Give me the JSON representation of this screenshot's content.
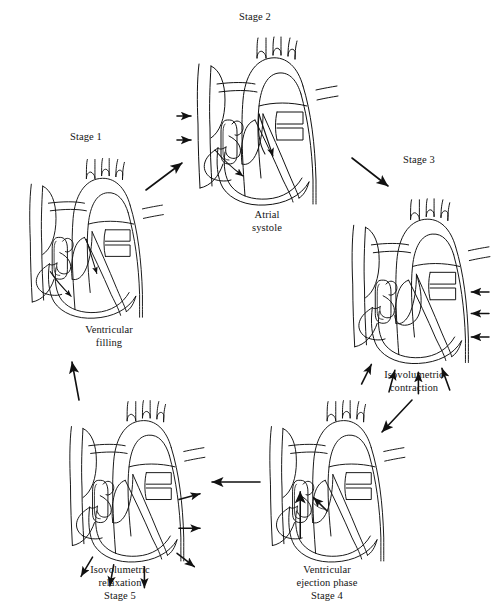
{
  "figure": {
    "type": "cyclic-process-diagram",
    "background_color": "#ffffff",
    "line_color": "#111111",
    "stage_count": 5,
    "flow_direction": "clockwise"
  },
  "stages": [
    {
      "id": "stage-1",
      "number_label": "Stage 1",
      "phase_label": "Ventricular\nfilling",
      "phase_label_flat": "Ventricular filling",
      "number_label_position": "above",
      "arrow_semantics": "blood flowing down into both ventricles",
      "internal_arrows": 2
    },
    {
      "id": "stage-2",
      "number_label": "Stage 2",
      "phase_label": "Atrial\nsystole",
      "phase_label_flat": "Atrial systole",
      "number_label_position": "above",
      "arrow_semantics": "atria contracting inward, blood pushed into ventricles",
      "internal_arrows": 4
    },
    {
      "id": "stage-3",
      "number_label": "Stage 3",
      "phase_label": "Isovolumetric\ncontraction",
      "phase_label_flat": "Isovolumetric contraction",
      "number_label_position": "above",
      "arrow_semantics": "ventricular walls squeezing inward, valves closed",
      "internal_arrows": 7
    },
    {
      "id": "stage-4",
      "number_label": "Stage 4",
      "phase_label": "Ventricular\nejection phase",
      "phase_label_flat": "Ventricular ejection phase",
      "number_label_position": "below",
      "arrow_semantics": "blood ejected upward through the outflow valves",
      "internal_arrows": 2
    },
    {
      "id": "stage-5",
      "number_label": "Stage 5",
      "phase_label": "Isovolumetric\nrelaxation",
      "phase_label_flat": "Isovolumetric relaxation",
      "number_label_position": "below",
      "arrow_semantics": "ventricular walls relaxing outward, valves closed",
      "internal_arrows": 6
    }
  ],
  "connectors": [
    {
      "id": "connector-1-2",
      "from": "stage-1",
      "to": "stage-2",
      "style": "diagonal-up-right"
    },
    {
      "id": "connector-2-3",
      "from": "stage-2",
      "to": "stage-3",
      "style": "diagonal-down-right"
    },
    {
      "id": "connector-3-4",
      "from": "stage-3",
      "to": "stage-4",
      "style": "diagonal-down-left"
    },
    {
      "id": "connector-4-5",
      "from": "stage-4",
      "to": "stage-5",
      "style": "horizontal-left"
    },
    {
      "id": "connector-5-1",
      "from": "stage-5",
      "to": "stage-1",
      "style": "vertical-up"
    }
  ]
}
